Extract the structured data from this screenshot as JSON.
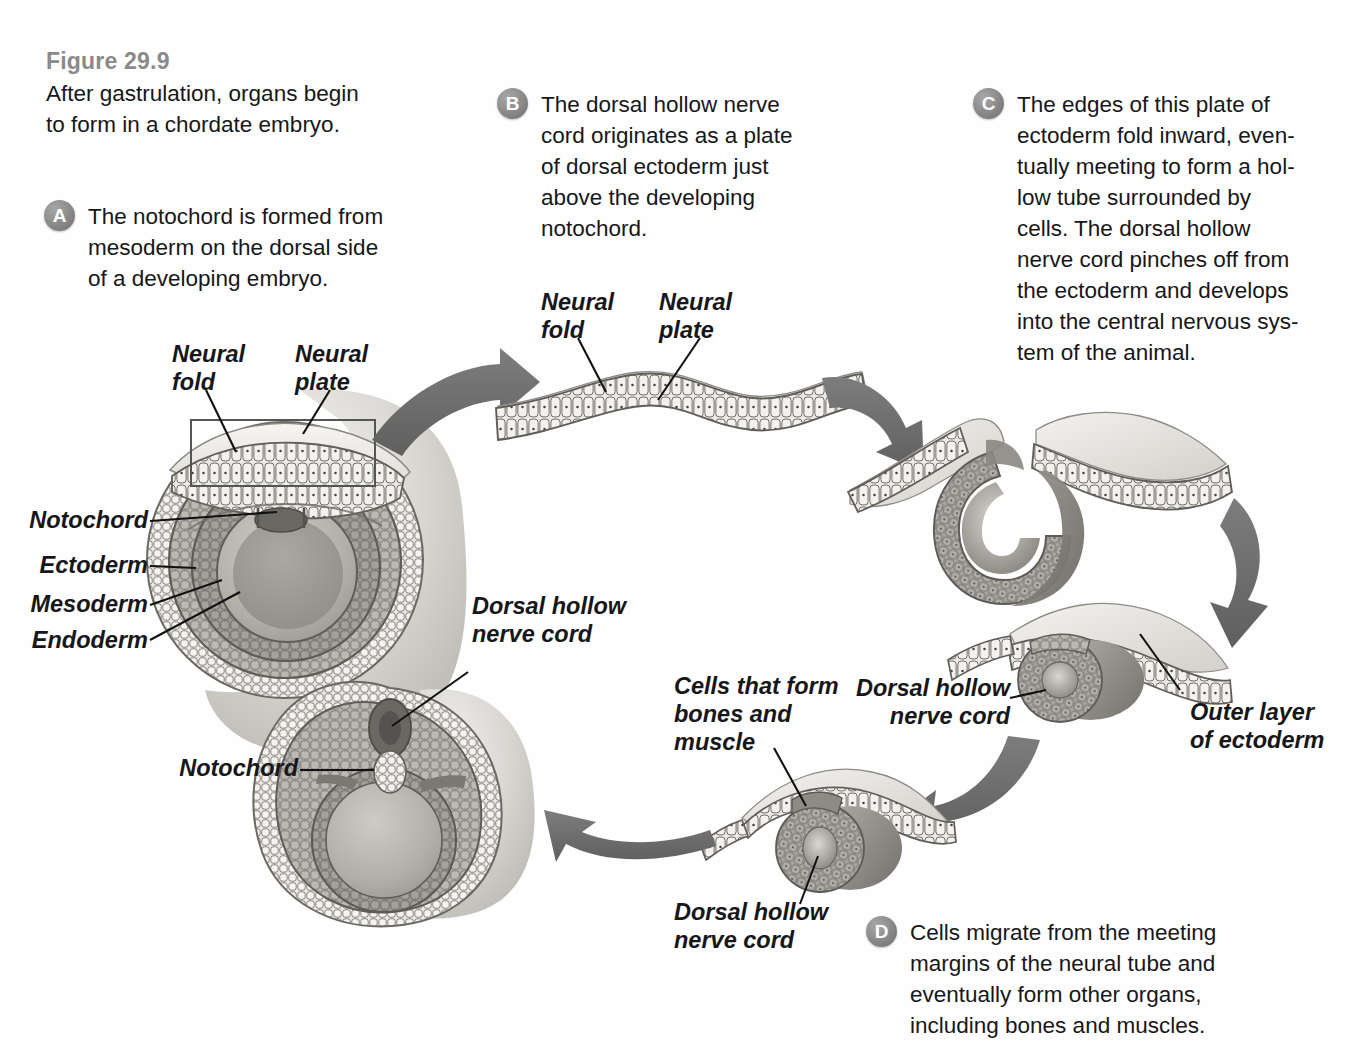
{
  "figure": {
    "number": "Figure 29.9",
    "lead": "After gastrulation, organs begin\nto form in a chordate embryo."
  },
  "captions": [
    {
      "badge": "A",
      "text": "The notochord is formed from\nmesoderm on the dorsal side\nof a developing embryo."
    },
    {
      "badge": "B",
      "text": "The dorsal hollow nerve\ncord originates as a plate\nof dorsal ectoderm just\nabove the developing\nnotochord."
    },
    {
      "badge": "C",
      "text": "The edges of this plate of\nectoderm fold inward, even-\ntually meeting to form a hol-\nlow tube surrounded by\ncells. The dorsal hollow\nnerve cord pinches off from\nthe ectoderm and develops\ninto the central nervous sys-\ntem of the animal."
    },
    {
      "badge": "D",
      "text": "Cells migrate from the meeting\nmargins of the neural tube and\neventually form other organs,\nincluding bones and muscles."
    }
  ],
  "labels": {
    "embryoA": {
      "neural_fold": "Neural\nfold",
      "neural_plate": "Neural\nplate",
      "notochord": "Notochord",
      "ectoderm": "Ectoderm",
      "mesoderm": "Mesoderm",
      "endoderm": "Endoderm"
    },
    "plateB": {
      "neural_fold": "Neural\nfold",
      "neural_plate": "Neural\nplate"
    },
    "tubeC": {
      "dorsal_nerve_cord": "Dorsal hollow\nnerve cord",
      "outer_ectoderm": "Outer layer\nof ectoderm"
    },
    "crestD": {
      "cells_bones_muscle": "Cells that form\nbones and\nmuscle",
      "dorsal_nerve_cord": "Dorsal hollow\nnerve cord"
    },
    "embryoFinal": {
      "dorsal_nerve_cord": "Dorsal hollow\nnerve cord",
      "notochord": "Notochord"
    }
  },
  "colors": {
    "arrow": "#6e6e6e",
    "badge": "#8e8e8e",
    "figure_number": "#8a8a8a",
    "text": "#17171a",
    "cell_light": "#e9e8e4",
    "cell_outline": "#6f6d68",
    "mesoderm": "#a9a6a0",
    "endoderm": "#8f8c86",
    "notochord_dark": "#6a6862",
    "sheet_light": "#eceae6"
  }
}
